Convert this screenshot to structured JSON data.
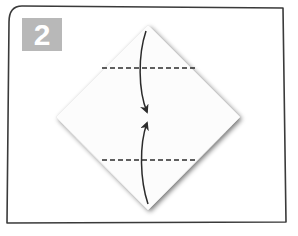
{
  "step": {
    "number": "2",
    "badge_color": "#b8b8b8"
  },
  "diagram": {
    "paper_color": "#ffffff",
    "line_color": "#2b2b2b",
    "fold_lines": [
      {
        "type": "valley",
        "position": "upper"
      },
      {
        "type": "valley",
        "position": "lower"
      }
    ],
    "arrows": [
      {
        "from": "top-corner",
        "to": "center",
        "direction": "down"
      },
      {
        "from": "bottom-corner",
        "to": "center",
        "direction": "up"
      }
    ]
  }
}
